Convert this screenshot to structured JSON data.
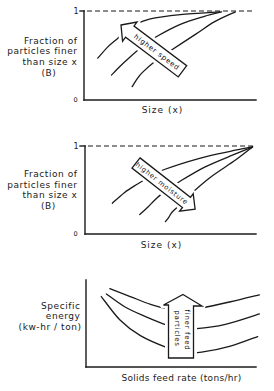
{
  "chart_data": [
    {
      "type": "line",
      "title": "",
      "xlabel": "Size (x)",
      "ylabel": "Fraction of particles finer than size x (B)",
      "ylabel_lines": [
        "Fraction of",
        "particles finer",
        "than size x",
        "(B)"
      ],
      "ytick_labels": {
        "top": "1",
        "bottom": "0"
      },
      "xlim": [
        0,
        1
      ],
      "ylim": [
        0,
        1
      ],
      "grid": false,
      "legend": null,
      "reference_lines": [
        {
          "y": 1,
          "style": "dashed"
        }
      ],
      "annotation": {
        "type": "arrow",
        "text": "higher speed",
        "direction": "up-left"
      },
      "series": [
        {
          "name": "curve 1",
          "points": [
            [
              0.08,
              0.47
            ],
            [
              0.14,
              0.6
            ],
            [
              0.2,
              0.7
            ],
            [
              0.24,
              0.78
            ],
            [
              0.29,
              0.84
            ],
            [
              0.38,
              0.91
            ],
            [
              0.56,
              0.96
            ],
            [
              0.79,
              0.99
            ]
          ]
        },
        {
          "name": "curve 2",
          "points": [
            [
              0.16,
              0.28
            ],
            [
              0.21,
              0.38
            ],
            [
              0.26,
              0.47
            ],
            [
              0.34,
              0.6
            ],
            [
              0.42,
              0.71
            ],
            [
              0.56,
              0.85
            ],
            [
              0.7,
              0.94
            ],
            [
              0.8,
              0.99
            ]
          ]
        },
        {
          "name": "curve 3",
          "points": [
            [
              0.28,
              0.15
            ],
            [
              0.31,
              0.24
            ],
            [
              0.34,
              0.31
            ],
            [
              0.41,
              0.43
            ],
            [
              0.5,
              0.55
            ],
            [
              0.65,
              0.74
            ],
            [
              0.76,
              0.88
            ],
            [
              0.88,
              0.99
            ]
          ]
        }
      ]
    },
    {
      "type": "line",
      "title": "",
      "xlabel": "Size (x)",
      "ylabel": "Fraction of particles finer than size x (B)",
      "ylabel_lines": [
        "Fraction of",
        "particles finer",
        "than size x",
        "(B)"
      ],
      "ytick_labels": {
        "top": "1",
        "bottom": "0"
      },
      "xlim": [
        0,
        1
      ],
      "ylim": [
        0,
        1
      ],
      "grid": false,
      "legend": null,
      "reference_lines": [
        {
          "y": 1,
          "style": "dashed"
        }
      ],
      "annotation": {
        "type": "arrow",
        "text": "higher moisture",
        "direction": "down-right"
      },
      "series": [
        {
          "name": "curve 1",
          "points": [
            [
              0.16,
              0.35
            ],
            [
              0.23,
              0.47
            ],
            [
              0.3,
              0.56
            ],
            [
              0.38,
              0.65
            ],
            [
              0.46,
              0.73
            ],
            [
              0.67,
              0.86
            ],
            [
              0.85,
              0.94
            ],
            [
              0.98,
              0.99
            ]
          ]
        },
        {
          "name": "curve 2",
          "points": [
            [
              0.32,
              0.22
            ],
            [
              0.37,
              0.31
            ],
            [
              0.41,
              0.39
            ],
            [
              0.47,
              0.49
            ],
            [
              0.54,
              0.58
            ],
            [
              0.7,
              0.76
            ],
            [
              0.88,
              0.91
            ],
            [
              0.98,
              0.99
            ]
          ]
        },
        {
          "name": "curve 3",
          "points": [
            [
              0.47,
              0.14
            ],
            [
              0.49,
              0.19
            ],
            [
              0.51,
              0.25
            ],
            [
              0.56,
              0.34
            ],
            [
              0.61,
              0.44
            ],
            [
              0.73,
              0.64
            ],
            [
              0.88,
              0.84
            ],
            [
              0.98,
              0.99
            ]
          ]
        }
      ]
    },
    {
      "type": "line",
      "title": "",
      "xlabel": "Solids feed rate (tons/hr)",
      "ylabel": "Specific energy (kw-hr / ton)",
      "ylabel_lines": [
        "Specific",
        "energy",
        "(kw-hr / ton)"
      ],
      "xlim": [
        0,
        1
      ],
      "ylim": [
        0,
        1
      ],
      "grid": false,
      "legend": null,
      "annotation": {
        "type": "arrow",
        "text": "finer feed particles",
        "text_lines": [
          "finer feed",
          "particles"
        ],
        "direction": "up"
      },
      "series": [
        {
          "name": "curve 1",
          "points": [
            [
              0.14,
              0.9
            ],
            [
              0.26,
              0.81
            ],
            [
              0.38,
              0.72
            ],
            [
              0.48,
              0.67
            ],
            [
              0.58,
              0.66
            ],
            [
              0.68,
              0.68
            ],
            [
              0.85,
              0.75
            ],
            [
              1.02,
              0.83
            ]
          ]
        },
        {
          "name": "curve 2",
          "points": [
            [
              0.12,
              0.84
            ],
            [
              0.23,
              0.69
            ],
            [
              0.35,
              0.58
            ],
            [
              0.48,
              0.48
            ],
            [
              0.57,
              0.45
            ],
            [
              0.65,
              0.44
            ],
            [
              0.82,
              0.49
            ],
            [
              1.02,
              0.61
            ]
          ]
        },
        {
          "name": "curve 3",
          "points": [
            [
              0.09,
              0.81
            ],
            [
              0.2,
              0.54
            ],
            [
              0.32,
              0.36
            ],
            [
              0.48,
              0.22
            ],
            [
              0.58,
              0.17
            ],
            [
              0.68,
              0.17
            ],
            [
              0.85,
              0.24
            ],
            [
              1.01,
              0.35
            ]
          ]
        }
      ]
    }
  ]
}
